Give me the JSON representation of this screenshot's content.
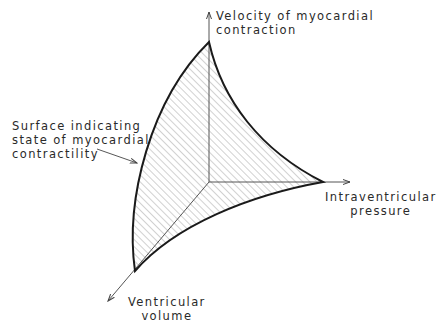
{
  "diagram": {
    "type": "3d-surface-schematic",
    "axes": {
      "y_axis_label_line1": "Velocity of myocardial",
      "y_axis_label_line2": "contraction",
      "x_axis_label_line1": "Intraventricular",
      "x_axis_label_line2": "pressure",
      "z_axis_label_line1": "Ventricular",
      "z_axis_label_line2": "volume"
    },
    "surface_label_line1": "Surface indicating",
    "surface_label_line2": "state of myocardial",
    "surface_label_line3": "contractility",
    "colors": {
      "outline": "#1a1a1a",
      "axis": "#555555",
      "hatch": "#9a9a9a"
    }
  }
}
